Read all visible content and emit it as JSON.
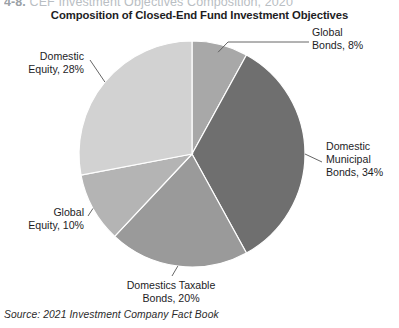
{
  "figure_header": {
    "number": "4-8.",
    "text": "CEF Investment Objectives Composition, 2020"
  },
  "chart_title": "Composition of Closed-End Fund Investment Objectives",
  "source_note": "Source: 2021 Investment Company Fact Book",
  "labels": {
    "global_bonds": "Global\nBonds, 8%",
    "domestic_municipal_bonds": "Domestic\nMunicipal\nBonds, 34%",
    "domestics_taxable_bonds": "Domestics Taxable\nBonds, 20%",
    "global_equity": "Global\nEquity, 10%",
    "domestic_equity": "Domestic\nEquity, 28%"
  },
  "chart_data": {
    "type": "pie",
    "title": "Composition of Closed-End Fund Investment Objectives",
    "xlabel": "",
    "ylabel": "",
    "legend_position": "none",
    "grid": false,
    "units": "percent",
    "start_angle_deg": 0,
    "direction": "clockwise",
    "total": 100,
    "categories": [
      "Global Bonds",
      "Domestic Municipal Bonds",
      "Domestics Taxable Bonds",
      "Global Equity",
      "Domestic Equity"
    ],
    "values": [
      8,
      34,
      20,
      10,
      28
    ],
    "slices": [
      {
        "label": "Global Bonds",
        "value": 8,
        "display": "Global Bonds, 8%",
        "color": "#a8a8a8"
      },
      {
        "label": "Domestic Municipal Bonds",
        "value": 34,
        "display": "Domestic Municipal Bonds, 34%",
        "color": "#6f6f6f"
      },
      {
        "label": "Domestics Taxable Bonds",
        "value": 20,
        "display": "Domestics Taxable Bonds, 20%",
        "color": "#9a9a9a"
      },
      {
        "label": "Global Equity",
        "value": 10,
        "display": "Global Equity, 10%",
        "color": "#b4b4b4"
      },
      {
        "label": "Domestic Equity",
        "value": 28,
        "display": "Domestic Equity, 28%",
        "color": "#d2d2d2"
      }
    ],
    "annotations": [
      "Global Bonds, 8%",
      "Domestic Municipal Bonds, 34%",
      "Domestics Taxable Bonds, 20%",
      "Global Equity, 10%",
      "Domestic Equity, 28%"
    ]
  },
  "colors": {
    "slice_global_bonds": "#a8a8a8",
    "slice_domestic_municipal_bonds": "#6f6f6f",
    "slice_domestics_taxable_bonds": "#9a9a9a",
    "slice_global_equity": "#b4b4b4",
    "slice_domestic_equity": "#d2d2d2",
    "leader_line": "#555555",
    "text": "#1d1d1f",
    "header_faded": "#b9bec3",
    "background": "#ffffff"
  }
}
